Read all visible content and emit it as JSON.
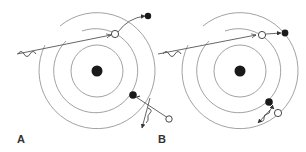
{
  "diagram": {
    "panels": [
      {
        "id": "A",
        "label": "A",
        "description": "Incident photon ejects outer-shell electron; inner electron emits photon on relaxation",
        "nucleus": {
          "cx": 97,
          "cy": 71,
          "r": 5
        },
        "shells": [
          26,
          42,
          58
        ]
      },
      {
        "id": "B",
        "label": "B",
        "description": "Incident photon ejects electron; relaxation energy ejects a second (Auger) electron",
        "nucleus": {
          "cx": 240,
          "cy": 71,
          "r": 5
        },
        "shells": [
          26,
          42,
          58
        ]
      }
    ],
    "colors": {
      "ring": "#8a8a8a",
      "electron_filled": "#1a1a1a",
      "vacancy": "#ffffff",
      "line": "#555555",
      "label": "#333333"
    }
  }
}
